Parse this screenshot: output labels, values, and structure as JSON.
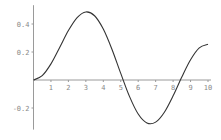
{
  "chart_data": {
    "type": "line",
    "title": "",
    "xlabel": "",
    "ylabel": "",
    "xlim": [
      0,
      10
    ],
    "ylim": [
      -0.34,
      0.52
    ],
    "grid": false,
    "legend": null,
    "x_ticks": [
      1,
      2,
      3,
      4,
      5,
      6,
      7,
      8,
      9,
      10
    ],
    "x_tick_labels": [
      "1",
      "2",
      "3",
      "4",
      "5",
      "6",
      "7",
      "8",
      "9",
      "10"
    ],
    "y_ticks": [
      0.4,
      0.2,
      -0.2
    ],
    "y_tick_labels": [
      "0.4",
      "0.2",
      "-0.2"
    ],
    "series": [
      {
        "name": "curve",
        "color": "#333333",
        "x": [
          0,
          0.5,
          1,
          1.5,
          2,
          2.5,
          3,
          3.5,
          4,
          4.5,
          5,
          5.5,
          6,
          6.5,
          7,
          7.5,
          8,
          8.5,
          9,
          9.5,
          10
        ],
        "values": [
          0,
          0.031,
          0.115,
          0.232,
          0.353,
          0.446,
          0.486,
          0.459,
          0.364,
          0.218,
          0.047,
          -0.117,
          -0.243,
          -0.307,
          -0.301,
          -0.23,
          -0.113,
          0.022,
          0.145,
          0.23,
          0.255
        ]
      }
    ],
    "features": {
      "peak": {
        "x": 3.05,
        "y": 0.486
      },
      "trough": {
        "x": 6.71,
        "y": -0.314
      },
      "zero_crossings": [
        5.14,
        8.42
      ]
    }
  },
  "layout": {
    "origin_px": [
      33.5,
      80
    ],
    "x_px_per_unit": 17.45,
    "y_px_per_unit": 140
  }
}
